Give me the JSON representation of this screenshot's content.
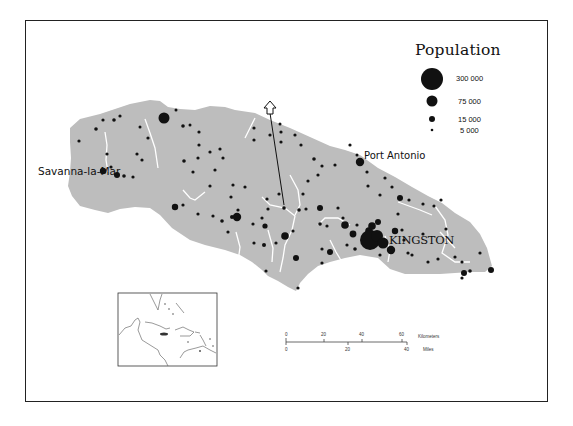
{
  "legend": {
    "title": "Population",
    "items": [
      {
        "label": "300 000",
        "radius": 11
      },
      {
        "label": "75 000",
        "radius": 5.5
      },
      {
        "label": "15 000",
        "radius": 3
      },
      {
        "label": "5 000",
        "radius": 1.3
      }
    ]
  },
  "places": {
    "savanna": "Savanna-la-Mar",
    "port_antonio": "Port Antonio",
    "kingston": "KINGSTON"
  },
  "scale_bar": {
    "km_ticks": [
      "0",
      "20",
      "40",
      "60"
    ],
    "km_unit": "Kilometers",
    "mile_ticks": [
      "0",
      "20",
      "40"
    ],
    "mile_unit": "Miles"
  },
  "colors": {
    "land": "#bdbdbd",
    "river": "#ffffff",
    "dot": "#111111",
    "frame": "#222222"
  },
  "inset": {
    "description": "Caribbean locator map"
  }
}
